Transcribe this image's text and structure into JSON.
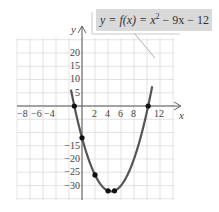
{
  "equation": {
    "lhs": "y = f(x) = x",
    "exp": "2",
    "rhs": " − 9x − 12"
  },
  "axes": {
    "x_label": "x",
    "y_label": "y",
    "x_ticks": [
      "−8",
      "−6",
      "−4",
      "2",
      "4",
      "6",
      "8",
      "12"
    ],
    "y_ticks": [
      "20",
      "15",
      "10",
      "5",
      "−15",
      "−20",
      "−25",
      "−30"
    ]
  },
  "colors": {
    "curve": "#555555",
    "grid": "#d8d8d8",
    "axis": "#555555",
    "label_box": "#d9d9d9"
  },
  "chart_data": {
    "type": "line",
    "xlabel": "x",
    "ylabel": "y",
    "xlim": [
      -10,
      14
    ],
    "ylim": [
      -35,
      25
    ],
    "grid": true,
    "function": "x^2 - 9x - 12",
    "x_tick_labels": [
      -8,
      -6,
      -4,
      2,
      4,
      6,
      8,
      12
    ],
    "y_tick_labels": [
      20,
      15,
      10,
      5,
      -15,
      -20,
      -25,
      -30
    ],
    "marked_points": [
      {
        "x": -1.18,
        "y": 0
      },
      {
        "x": 0,
        "y": -12
      },
      {
        "x": 2,
        "y": -26
      },
      {
        "x": 4,
        "y": -32
      },
      {
        "x": 5,
        "y": -32
      },
      {
        "x": 10.18,
        "y": 0
      }
    ],
    "series": [
      {
        "name": "f(x) = x^2 − 9x − 12",
        "x": [
          -1.7,
          -1.18,
          0,
          1,
          2,
          3,
          4,
          4.5,
          5,
          6,
          7,
          8,
          9,
          10,
          10.18,
          10.8
        ],
        "values": [
          -1.81,
          0,
          -12,
          -20,
          -26,
          -30,
          -32,
          -32.25,
          -32,
          -30,
          -26,
          -20,
          -12,
          -2,
          0,
          7.44
        ]
      }
    ]
  }
}
